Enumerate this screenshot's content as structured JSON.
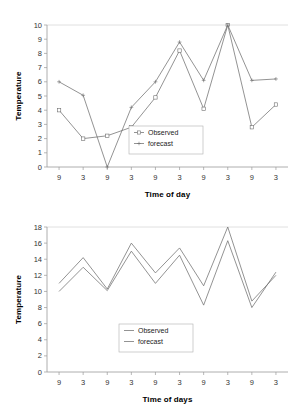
{
  "figures": [
    {
      "id": "top",
      "chart_data": {
        "type": "line",
        "title": "",
        "xlabel": "Time of day",
        "ylabel": "Temperature",
        "categories": [
          "9",
          "3",
          "9",
          "3",
          "9",
          "3",
          "9",
          "3",
          "9",
          "3"
        ],
        "ylim": [
          0,
          10
        ],
        "yticks": [
          0,
          1,
          2,
          3,
          4,
          5,
          6,
          7,
          8,
          9,
          10
        ],
        "grid": false,
        "legend_position": "center",
        "series": [
          {
            "name": "Observed",
            "marker": "open-square",
            "values": [
              4.0,
              2.0,
              2.2,
              2.8,
              4.9,
              8.2,
              4.1,
              10.0,
              2.8,
              4.4
            ]
          },
          {
            "name": "forecast",
            "marker": "cross",
            "values": [
              6.0,
              5.05,
              0.0,
              4.2,
              6.0,
              8.8,
              6.1,
              10.0,
              6.1,
              6.2
            ]
          }
        ]
      }
    },
    {
      "id": "bottom",
      "chart_data": {
        "type": "line",
        "title": "",
        "xlabel": "Time of days",
        "ylabel": "Temperature",
        "categories": [
          "9",
          "3",
          "9",
          "3",
          "9",
          "3",
          "9",
          "3",
          "9",
          "3"
        ],
        "ylim": [
          0,
          18
        ],
        "yticks": [
          0,
          2,
          4,
          6,
          8,
          10,
          12,
          14,
          16,
          18
        ],
        "grid": false,
        "legend_position": "center",
        "series": [
          {
            "name": "Observed",
            "marker": "line",
            "values": [
              10.0,
              13.0,
              10.1,
              15.0,
              11.0,
              14.5,
              8.3,
              16.3,
              8.0,
              12.4
            ]
          },
          {
            "name": "forecast",
            "marker": "line",
            "values": [
              11.0,
              14.2,
              10.3,
              16.0,
              12.3,
              15.4,
              10.7,
              18.0,
              8.8,
              12.0
            ]
          }
        ]
      }
    }
  ],
  "legend": {
    "observed_label": "Observed",
    "forecast_label": "forecast"
  },
  "colors": {
    "series_stroke": "#6f6f6f",
    "axis": "#9a9a9a",
    "text": "#000000",
    "background": "#ffffff"
  }
}
